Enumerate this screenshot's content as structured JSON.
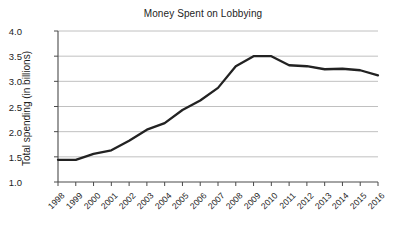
{
  "chart_data": {
    "type": "line",
    "title": "Money Spent on Lobbying",
    "xlabel": "",
    "ylabel": "Total spending (in billions)",
    "categories": [
      "1998",
      "1999",
      "2000",
      "2001",
      "2002",
      "2003",
      "2004",
      "2005",
      "2006",
      "2007",
      "2008",
      "2009",
      "2010",
      "2011",
      "2012",
      "2013",
      "2014",
      "2015",
      "2016"
    ],
    "values": [
      1.44,
      1.44,
      1.56,
      1.63,
      1.82,
      2.04,
      2.17,
      2.43,
      2.62,
      2.87,
      3.3,
      3.5,
      3.5,
      3.32,
      3.3,
      3.24,
      3.25,
      3.22,
      3.12
    ],
    "series": [
      {
        "name": "Total spending",
        "values": [
          1.44,
          1.44,
          1.56,
          1.63,
          1.82,
          2.04,
          2.17,
          2.43,
          2.62,
          2.87,
          3.3,
          3.5,
          3.5,
          3.32,
          3.3,
          3.24,
          3.25,
          3.22,
          3.12
        ]
      }
    ],
    "ylim": [
      1.0,
      4.0
    ],
    "ytick_labels": [
      "1.0",
      "1.5",
      "2.0",
      "2.5",
      "3.0",
      "3.5",
      "4.0"
    ],
    "ytick_values": [
      1.0,
      1.5,
      2.0,
      2.5,
      3.0,
      3.5,
      4.0
    ],
    "grid": true,
    "grid_axis": "y",
    "legend": false,
    "legend_position": "none",
    "line_color": "#222222",
    "grid_color": "#b9b9b9",
    "axis_color": "#4a4a4a",
    "background_color": "#ffffff"
  }
}
